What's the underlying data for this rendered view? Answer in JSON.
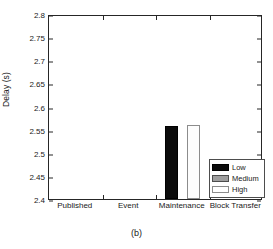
{
  "caption": "(b)",
  "chart_data": {
    "type": "bar",
    "title": "",
    "xlabel": "",
    "ylabel": "Delay (s)",
    "categories": [
      "Published",
      "Event",
      "Maintenance",
      "Block Transfer"
    ],
    "ylim": [
      2.4,
      2.8
    ],
    "yticks": [
      "2.4",
      "2.45",
      "2.5",
      "2.55",
      "2.6",
      "2.65",
      "2.7",
      "2.75",
      "2.8"
    ],
    "ytick_values": [
      2.4,
      2.45,
      2.5,
      2.55,
      2.6,
      2.65,
      2.7,
      2.75,
      2.8
    ],
    "grid": false,
    "legend": {
      "position": "inside-lower-right",
      "entries": [
        {
          "name": "Low",
          "color": "#0b0b0b"
        },
        {
          "name": "Medium",
          "color": "#9e9e9e"
        },
        {
          "name": "High",
          "color": "#ffffff"
        }
      ]
    },
    "series": [
      {
        "name": "Low",
        "color": "#0b0b0b",
        "values": [
          0,
          0,
          2.557,
          0
        ]
      },
      {
        "name": "Medium",
        "color": "#9e9e9e",
        "values": [
          0,
          0,
          0,
          0
        ]
      },
      {
        "name": "High",
        "color": "#ffffff",
        "values": [
          0,
          0,
          2.56,
          0
        ]
      }
    ]
  }
}
